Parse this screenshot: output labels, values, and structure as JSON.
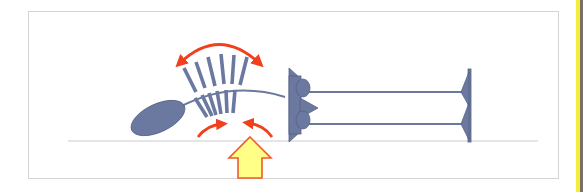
{
  "diagram": {
    "type": "illustration",
    "colors": {
      "structure": "#6b78a0",
      "structure_outline": "#566287",
      "motion_arrow": "#f0401e",
      "stimulus_fill": "#ffff88",
      "stimulus_outline": "#f05a28",
      "ground_line": "#c8ccd6",
      "frame_border": "#d4d4d4",
      "side_strip": "#f2ee3a"
    },
    "elements": [
      {
        "name": "cell-body",
        "shape": "tilted ellipse"
      },
      {
        "name": "flagellum",
        "shape": "curved line from cell body to left anchor"
      },
      {
        "name": "cilia-fan",
        "shape": "fan of bars above and below the flagellum"
      },
      {
        "name": "oscillation-arrow",
        "shape": "double-headed curved arrow above cilia"
      },
      {
        "name": "inward-arrows",
        "shape": "two small curved arrows pointing toward cilia base"
      },
      {
        "name": "stimulus-arrow",
        "shape": "large yellow upward block arrow"
      },
      {
        "name": "left-anchor",
        "shape": "triangular block with two rounded knobs"
      },
      {
        "name": "fibers",
        "shape": "two horizontal parallel lines"
      },
      {
        "name": "right-anchor",
        "shape": "vertical bar with two leftward barbs"
      },
      {
        "name": "ground-line",
        "shape": "horizontal baseline"
      }
    ],
    "labels": []
  }
}
